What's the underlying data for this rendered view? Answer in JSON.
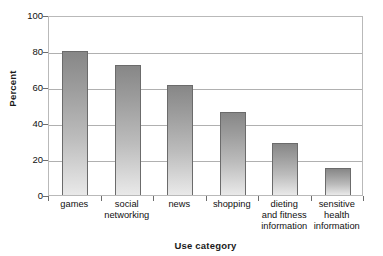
{
  "chart_data": {
    "type": "bar",
    "title": "",
    "subtitle": "",
    "xlabel": "Use category",
    "ylabel": "Percent",
    "categories": [
      "games",
      "social networking",
      "news",
      "shopping",
      "dieting and fitness information",
      "sensitive health information"
    ],
    "category_lines": [
      [
        "games"
      ],
      [
        "social",
        "networking"
      ],
      [
        "news"
      ],
      [
        "shopping"
      ],
      [
        "dieting",
        "and fitness",
        "information"
      ],
      [
        "sensitive",
        "health",
        "information"
      ]
    ],
    "values": [
      80,
      72,
      61,
      46,
      29,
      15
    ],
    "ylim": [
      0,
      100
    ],
    "yticks": [
      0,
      20,
      40,
      60,
      80,
      100
    ],
    "ytick_labels": [
      "0",
      "20",
      "40",
      "60",
      "80",
      "100"
    ],
    "grid": "horizontal",
    "legend": "none",
    "annotations": [],
    "colors": {
      "bar_fill_top": "#878787",
      "bar_fill_bottom": "#e9e9e9",
      "bar_outline": "#6b6b6b",
      "gridline": "#b0b0b0",
      "axis": "#b9b9b9",
      "text": "#111111",
      "background": "#ffffff"
    }
  }
}
